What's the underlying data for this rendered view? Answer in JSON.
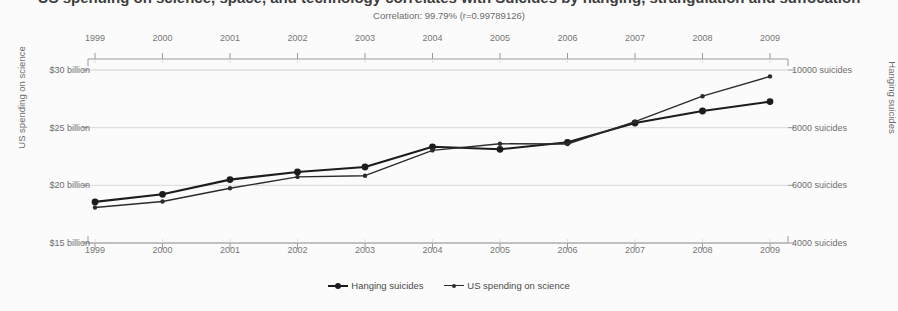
{
  "chart_data": {
    "type": "line",
    "title": "US spending on science, space, and technology correlates with Suicides by hanging, strangulation and suffocation",
    "subtitle": "Correlation: 99.79% (r=0.99789126)",
    "x": [
      1999,
      2000,
      2001,
      2002,
      2003,
      2004,
      2005,
      2006,
      2007,
      2008,
      2009
    ],
    "categories": [
      "1999",
      "2000",
      "2001",
      "2002",
      "2003",
      "2004",
      "2005",
      "2006",
      "2007",
      "2008",
      "2009"
    ],
    "series": [
      {
        "name": "Hanging suicides",
        "axis": "right",
        "unit": "suicides",
        "color": "#1c1c1c",
        "values": [
          5427,
          5688,
          6198,
          6462,
          6635,
          7336,
          7248,
          7491,
          8161,
          8578,
          8905
        ]
      },
      {
        "name": "US spending on science",
        "axis": "left",
        "unit": "billion USD",
        "color": "#2b2b2b",
        "values": [
          18.079,
          18.594,
          19.753,
          20.734,
          20.831,
          23.029,
          23.597,
          23.584,
          25.525,
          27.731,
          29.449
        ]
      }
    ],
    "xlabel": "",
    "ylabel_left": "US spending on science",
    "ylabel_right": "Hanging suicides",
    "left_axis": {
      "ticks": [
        {
          "value": 30,
          "label": "$30 billion"
        },
        {
          "value": 25,
          "label": "$25 billion"
        },
        {
          "value": 20,
          "label": "$20 billion"
        },
        {
          "value": 15,
          "label": "$15 billion"
        }
      ],
      "ylim": [
        15,
        30
      ]
    },
    "right_axis": {
      "ticks": [
        {
          "value": 10000,
          "label": "10000 suicides"
        },
        {
          "value": 8000,
          "label": "8000 suicides"
        },
        {
          "value": 6000,
          "label": "6000 suicides"
        },
        {
          "value": 4000,
          "label": "4000 suicides"
        }
      ],
      "ylim": [
        4000,
        10000
      ]
    },
    "grid": true,
    "legend_position": "bottom",
    "legend": [
      "Hanging suicides",
      "US spending on science"
    ]
  },
  "legend": {
    "item_a": "Hanging suicides",
    "item_b": "US spending on science"
  }
}
